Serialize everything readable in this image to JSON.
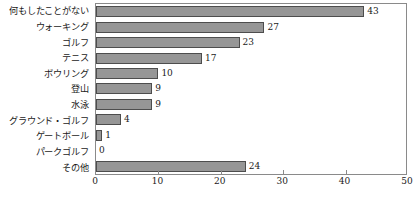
{
  "chart_data": {
    "type": "bar",
    "orientation": "horizontal",
    "title": "",
    "xlabel": "",
    "ylabel": "",
    "xlim": [
      0,
      50
    ],
    "xticks": [
      0,
      10,
      20,
      30,
      40,
      50
    ],
    "xtick_labels": [
      "0",
      "10",
      "20",
      "30",
      "40",
      "50"
    ],
    "grid": false,
    "legend": false,
    "bar_fill_color": "#969696",
    "bar_border_color": "#4d4d4d",
    "frame_color": "#8a8a8a",
    "categories": [
      "何もしたことがない",
      "ウォーキング",
      "ゴルフ",
      "テニス",
      "ボウリング",
      "登山",
      "水泳",
      "グラウンド・ゴルフ",
      "ゲートボール",
      "パークゴルフ",
      "その他"
    ],
    "values": [
      43,
      27,
      23,
      17,
      10,
      9,
      9,
      4,
      1,
      0,
      24
    ],
    "value_labels": [
      "43",
      "27",
      "23",
      "17",
      "10",
      "9",
      "9",
      "4",
      "1",
      "0",
      "24"
    ]
  }
}
